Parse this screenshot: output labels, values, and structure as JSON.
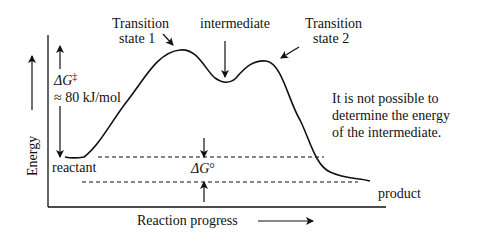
{
  "diagram": {
    "type": "reaction-energy-profile",
    "axes": {
      "y_label": "Energy",
      "x_label": "Reaction progress"
    },
    "labels": {
      "ts1_line1": "Transition",
      "ts1_line2": "state 1",
      "intermediate": "intermediate",
      "ts2_line1": "Transition",
      "ts2_line2": "state 2",
      "activation_symbol": "ΔG",
      "activation_superscript": "‡",
      "activation_value": "≈ 80 kJ/mol",
      "reactant": "reactant",
      "product": "product",
      "delta_g_standard_symbol": "ΔG",
      "delta_g_standard_superscript": "°",
      "note_line1": "It is not possible to",
      "note_line2": "determine the energy",
      "note_line3": "of the intermediate."
    },
    "nodes": [
      {
        "name": "reactant",
        "relative_energy": "start level"
      },
      {
        "name": "Transition state 1",
        "relative_energy": "highest peak, ≈80 kJ/mol above reactant"
      },
      {
        "name": "intermediate",
        "relative_energy": "local minimum between peaks"
      },
      {
        "name": "Transition state 2",
        "relative_energy": "second peak, lower than TS1"
      },
      {
        "name": "product",
        "relative_energy": "below reactant by ΔG°"
      }
    ],
    "colors": {
      "stroke": "#111111",
      "background": "#ffffff"
    }
  }
}
